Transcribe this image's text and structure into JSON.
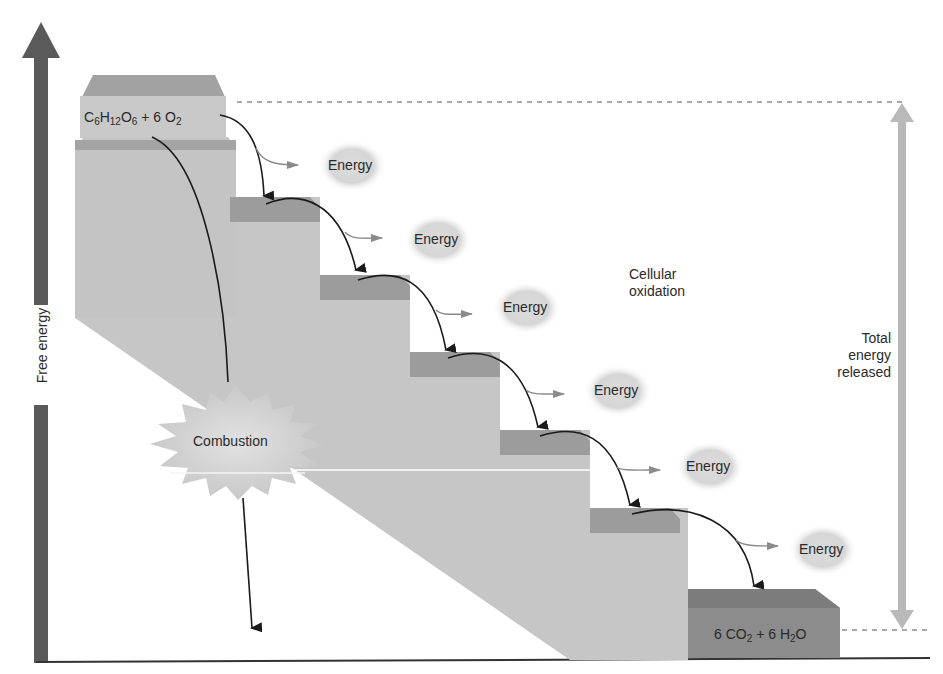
{
  "diagram": {
    "type": "energy-staircase",
    "y_axis": {
      "label": "Free energy",
      "color": "#555555"
    },
    "start": {
      "label_parts": [
        "C",
        "6",
        "H",
        "12",
        "O",
        "6",
        " + 6 O",
        "2"
      ],
      "label_text": "C6H12O6 + 6 O2"
    },
    "end": {
      "label_parts": [
        "6 CO",
        "2",
        " + 6 H",
        "2",
        "O"
      ],
      "label_text": "6 CO2 + 6 H2O"
    },
    "pathways": {
      "stepwise": {
        "label": "Cellular oxidation",
        "line1": "Cellular",
        "line2": "oxidation"
      },
      "direct": {
        "label": "Combustion"
      }
    },
    "energy_labels": [
      "Energy",
      "Energy",
      "Energy",
      "Energy",
      "Energy",
      "Energy"
    ],
    "total": {
      "line1": "Total",
      "line2": "energy",
      "line3": "released"
    },
    "colors": {
      "step_face": "#c4c4c4",
      "step_top": "#9a9a9a",
      "end_block": "#8e8e8e",
      "axis": "#555555",
      "total_arrow": "#b8b8b8",
      "energy_glow": "#d8d8d8",
      "text": "#2a2a2a"
    }
  }
}
